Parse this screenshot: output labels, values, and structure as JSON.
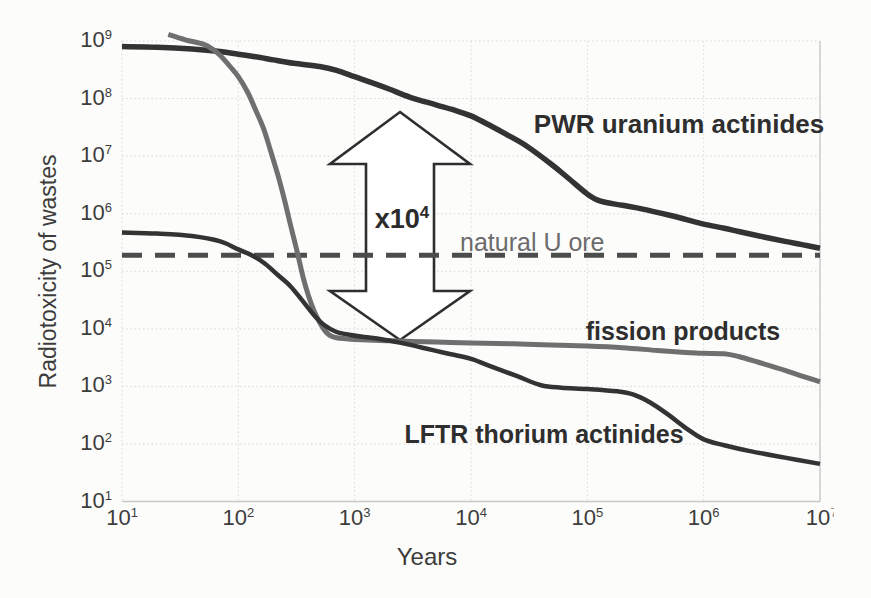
{
  "chart_data": {
    "type": "line",
    "title": "",
    "xlabel": "Years",
    "ylabel": "Radiotoxicity of wastes",
    "x_scale": "log",
    "y_scale": "log",
    "xlim": [
      10,
      10000000
    ],
    "ylim": [
      10,
      1000000000
    ],
    "grid": true,
    "tick_base": "10",
    "x_ticks": [
      {
        "exp": "1"
      },
      {
        "exp": "2"
      },
      {
        "exp": "3"
      },
      {
        "exp": "4"
      },
      {
        "exp": "5"
      },
      {
        "exp": "6"
      },
      {
        "exp": "7",
        "clipped": true
      }
    ],
    "y_ticks": [
      {
        "exp": "9"
      },
      {
        "exp": "8"
      },
      {
        "exp": "7"
      },
      {
        "exp": "6"
      },
      {
        "exp": "5"
      },
      {
        "exp": "4"
      },
      {
        "exp": "3"
      },
      {
        "exp": "2"
      },
      {
        "exp": "1"
      }
    ],
    "series": [
      {
        "name": "PWR uranium actinides",
        "color": "#333333",
        "width": 5.5,
        "style": "solid",
        "points": [
          [
            10,
            800000000.0
          ],
          [
            20,
            780000000.0
          ],
          [
            40,
            730000000.0
          ],
          [
            70,
            660000000.0
          ],
          [
            100,
            590000000.0
          ],
          [
            150,
            520000000.0
          ],
          [
            200,
            470000000.0
          ],
          [
            300,
            410000000.0
          ],
          [
            500,
            360000000.0
          ],
          [
            700,
            310000000.0
          ],
          [
            1000,
            240000000.0
          ],
          [
            1500,
            180000000.0
          ],
          [
            2000,
            145000000.0
          ],
          [
            3000,
            105000000.0
          ],
          [
            5000,
            78000000.0
          ],
          [
            7000,
            64000000.0
          ],
          [
            10000,
            50000000.0
          ],
          [
            15000,
            33000000.0
          ],
          [
            20000,
            24000000.0
          ],
          [
            30000,
            15000000.0
          ],
          [
            50000,
            7000000.0
          ],
          [
            70000,
            4000000.0
          ],
          [
            100000,
            2200000.0
          ],
          [
            130000,
            1650000.0
          ],
          [
            200000,
            1400000.0
          ],
          [
            300000,
            1200000.0
          ],
          [
            500000,
            950000.0
          ],
          [
            700000,
            800000.0
          ],
          [
            1000000,
            660000.0
          ],
          [
            1500000,
            560000.0
          ],
          [
            2000000,
            490000.0
          ],
          [
            3000000,
            410000.0
          ],
          [
            5000000,
            330000.0
          ],
          [
            7000000,
            290000.0
          ],
          [
            10000000,
            250000.0
          ]
        ]
      },
      {
        "name": "fission products",
        "color": "#6f6f6f",
        "width": 5,
        "style": "solid",
        "points": [
          [
            25,
            1300000000.0
          ],
          [
            35,
            1050000000.0
          ],
          [
            50,
            880000000.0
          ],
          [
            60,
            720000000.0
          ],
          [
            70,
            560000000.0
          ],
          [
            85,
            360000000.0
          ],
          [
            100,
            240000000.0
          ],
          [
            120,
            130000000.0
          ],
          [
            140,
            65000000.0
          ],
          [
            165,
            30000000.0
          ],
          [
            190,
            12000000.0
          ],
          [
            220,
            4500000.0
          ],
          [
            250,
            1700000.0
          ],
          [
            280,
            650000.0
          ],
          [
            320,
            220000.0
          ],
          [
            360,
            80000.0
          ],
          [
            400,
            38000.0
          ],
          [
            450,
            20000.0
          ],
          [
            500,
            13000.0
          ],
          [
            560,
            9000.0
          ],
          [
            620,
            7600.0
          ],
          [
            700,
            7000.0
          ],
          [
            850,
            6700.0
          ],
          [
            1000,
            6500.0
          ],
          [
            2000,
            6200.0
          ],
          [
            5000,
            5900.0
          ],
          [
            10000,
            5700.0
          ],
          [
            30000,
            5400.0
          ],
          [
            100000,
            5000.0
          ],
          [
            200000,
            4700.0
          ],
          [
            400000,
            4200.0
          ],
          [
            700000,
            3900.0
          ],
          [
            1000000,
            3750.0
          ],
          [
            1500000,
            3700.0
          ],
          [
            2000000,
            3300.0
          ],
          [
            3000000,
            2600.0
          ],
          [
            5000000,
            1900.0
          ],
          [
            7000000,
            1500.0
          ],
          [
            10000000,
            1200.0
          ]
        ]
      },
      {
        "name": "LFTR thorium actinides",
        "color": "#333333",
        "width": 4.5,
        "style": "solid",
        "points": [
          [
            10,
            470000.0
          ],
          [
            20,
            450000.0
          ],
          [
            40,
            410000.0
          ],
          [
            70,
            330000.0
          ],
          [
            100,
            240000.0
          ],
          [
            130,
            190000.0
          ],
          [
            170,
            135000.0
          ],
          [
            220,
            85000.0
          ],
          [
            280,
            55000.0
          ],
          [
            350,
            32000.0
          ],
          [
            450,
            17000.0
          ],
          [
            550,
            11500.0
          ],
          [
            700,
            8800.0
          ],
          [
            900,
            7900.0
          ],
          [
            1200,
            7200.0
          ],
          [
            1700,
            6600.0
          ],
          [
            2500,
            5700.0
          ],
          [
            4000,
            4600.0
          ],
          [
            6000,
            3800.0
          ],
          [
            10000,
            3000.0
          ],
          [
            15000,
            2200.0
          ],
          [
            25000,
            1500.0
          ],
          [
            40000,
            1050.0
          ],
          [
            60000,
            950.0
          ],
          [
            100000,
            900.0
          ],
          [
            180000,
            820.0
          ],
          [
            250000,
            720.0
          ],
          [
            350000,
            520.0
          ],
          [
            500000,
            320.0
          ],
          [
            700000,
            190.0
          ],
          [
            1000000,
            120.0
          ],
          [
            1500000,
            95.0
          ],
          [
            2500000,
            75.0
          ],
          [
            5000000,
            58.0
          ],
          [
            10000000,
            45.0
          ]
        ]
      },
      {
        "name": "natural U ore",
        "color": "#4c4c4c",
        "width": 5,
        "style": "dashed",
        "points": [
          [
            10,
            190000.0
          ],
          [
            10000000,
            190000.0
          ]
        ]
      }
    ],
    "annotations": {
      "pwr": "PWR uranium actinides",
      "fission": "fission products",
      "lftr": "LFTR thorium actinides",
      "natural_u": "natural U ore",
      "multiplier": {
        "text": "x10",
        "exp": "4"
      }
    },
    "colors": {
      "grid": "#d9d9d9",
      "frame": "#c8c8c8",
      "arrow_outline": "#2e2e2e",
      "arrow_fill": "#ffffff",
      "text": "#3c3c3c"
    }
  }
}
